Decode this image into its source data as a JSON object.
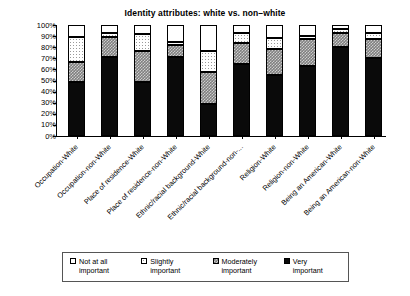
{
  "chart_data": {
    "type": "bar",
    "subtype": "stacked-percent",
    "title": "Identity attributes: white vs. non–white",
    "xlabel": "",
    "ylabel": "",
    "ylim": [
      0,
      100
    ],
    "yticks": [
      "0%",
      "10%",
      "20%",
      "30%",
      "40%",
      "50%",
      "60%",
      "70%",
      "80%",
      "90%",
      "100%"
    ],
    "grid": false,
    "legend_position": "bottom",
    "categories": [
      "Occupation-White",
      "Occupation-non-White",
      "Place of residence-White",
      "Place of residence-non-White",
      "Ethnic/racial background-White",
      "Ethnic/racial background-non-...",
      "Religion-White",
      "Religion-non-White",
      "Being an American-White",
      "Being an American-non-White"
    ],
    "series": [
      {
        "name": "Very important",
        "fill": "very",
        "values": [
          49,
          71,
          49,
          71,
          29,
          65,
          55,
          63,
          80,
          70
        ]
      },
      {
        "name": "Moderately important",
        "fill": "moderately",
        "values": [
          18,
          18,
          28,
          11,
          29,
          19,
          23,
          24,
          13,
          17
        ]
      },
      {
        "name": "Slightly important",
        "fill": "slightly",
        "values": [
          22,
          4,
          15,
          3,
          19,
          9,
          10,
          3,
          3,
          6
        ]
      },
      {
        "name": "Not at all important",
        "fill": "notatall",
        "values": [
          11,
          7,
          8,
          15,
          23,
          7,
          12,
          10,
          4,
          7
        ]
      }
    ]
  },
  "legend": {
    "items": [
      {
        "label": "Not at all\nimportant",
        "fill": "notatall"
      },
      {
        "label": "Slightly\nimportant",
        "fill": "slightly"
      },
      {
        "label": "Moderately\nimportant",
        "fill": "moderately"
      },
      {
        "label": "Very\nimportant",
        "fill": "very"
      }
    ]
  }
}
